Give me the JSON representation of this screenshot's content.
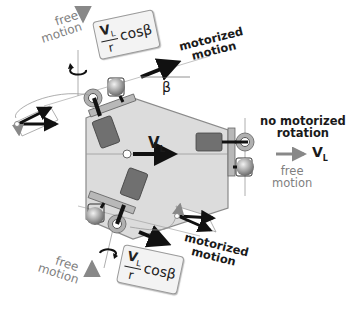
{
  "diagram": {
    "type": "omnidirectional mobile robot wheel kinematics",
    "colors": {
      "chassis_fill": "#dcdcdc",
      "chassis_stroke": "#8a8a8a",
      "motor_block": "#707070",
      "wheel_ring": "#a8a8a8",
      "arrow_dark": "#111111",
      "arrow_gray": "#888888",
      "text_gray": "#7f7f7f",
      "formula_bg": "#f3f3f3"
    },
    "top_wheel": {
      "free_motion_label_line1": "free",
      "free_motion_label_line2": "motion",
      "formula": {
        "numerator": "V",
        "numerator_sub": "L",
        "denominator": "r",
        "trailing": "cosβ"
      },
      "motorized_label_line1": "motorized",
      "motorized_label_line2": "motion",
      "angle_label": "β"
    },
    "bottom_wheel": {
      "free_motion_label_line1": "free",
      "free_motion_label_line2": "motion",
      "formula": {
        "numerator": "V",
        "numerator_sub": "L",
        "denominator": "r",
        "trailing": "cosβ"
      },
      "motorized_label_line1": "motorized",
      "motorized_label_line2": "motion"
    },
    "right_wheel": {
      "label_line1": "no motorized",
      "label_line2": "rotation",
      "velocity_label": "V",
      "velocity_sub": "L",
      "free_motion_label_line1": "free",
      "free_motion_label_line2": "motion"
    },
    "center": {
      "velocity_label": "V",
      "velocity_sub": "L"
    }
  }
}
